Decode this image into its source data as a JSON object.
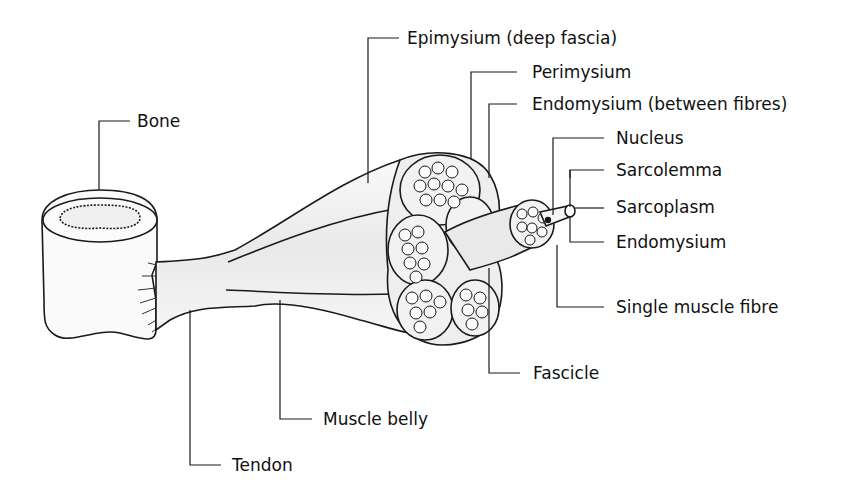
{
  "diagram": {
    "colors": {
      "line": "#1a1a1a",
      "fill_light": "#f4f4f4",
      "fill_mid": "#e6e6e6",
      "background": "#ffffff"
    },
    "labels": {
      "bone": "Bone",
      "epimysium": "Epimysium (deep fascia)",
      "perimysium": "Perimysium",
      "endomysium_between": "Endomysium (between fibres)",
      "nucleus": "Nucleus",
      "sarcolemma": "Sarcolemma",
      "sarcoplasm": "Sarcoplasm",
      "endomysium": "Endomysium",
      "single_fibre": "Single muscle fibre",
      "fascicle": "Fascicle",
      "muscle_belly": "Muscle belly",
      "tendon": "Tendon"
    }
  }
}
